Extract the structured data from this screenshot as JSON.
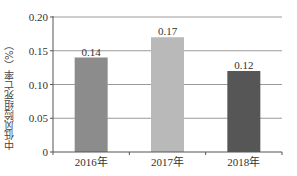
{
  "chart_data": {
    "type": "bar",
    "title": "",
    "xlabel": "",
    "ylabel": "中低风险组死亡率（%）",
    "categories": [
      "2016年",
      "2017年",
      "2018年"
    ],
    "values": [
      0.14,
      0.17,
      0.12
    ],
    "data_labels": [
      "0.14",
      "0.17",
      "0.12"
    ],
    "bar_colors": [
      "#8c8c8c",
      "#b9b9b9",
      "#565656"
    ],
    "ylim": [
      0,
      0.2
    ],
    "yticks": [
      0,
      0.05,
      0.1,
      0.15,
      0.2
    ],
    "ytick_labels": [
      "0",
      "0.05",
      "0.10",
      "0.15",
      "0.20"
    ],
    "grid": true,
    "legend": null
  }
}
